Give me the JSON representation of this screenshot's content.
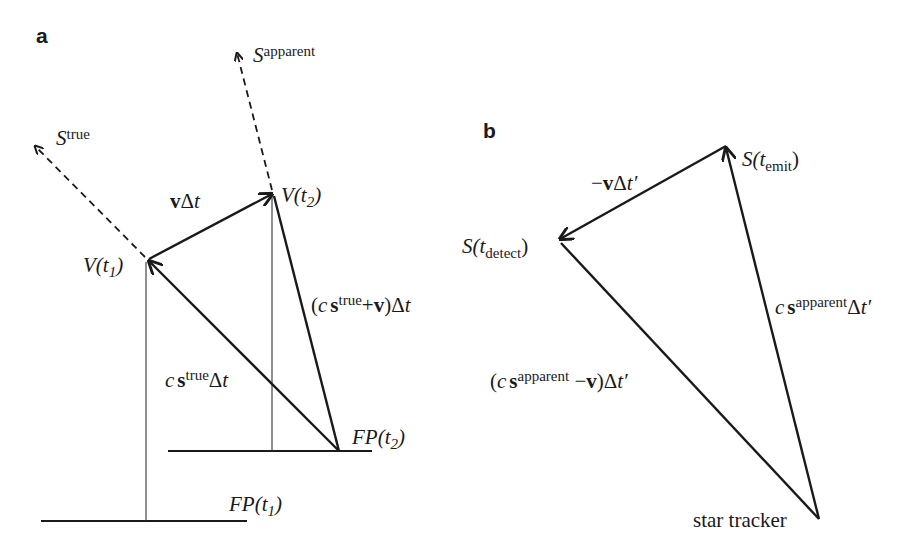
{
  "figure": {
    "panel_a": {
      "label": "a",
      "labels": {
        "s_apparent": {
          "base": "S",
          "sup": "apparent"
        },
        "s_true": {
          "base": "S",
          "sup": "true"
        },
        "v_t2": {
          "pre": "V(",
          "var": "t",
          "sub": "2",
          "post": ")"
        },
        "v_t1": {
          "pre": "V(",
          "var": "t",
          "sub": "1",
          "post": ")"
        },
        "v_delta_t": {
          "bold": "v",
          "rest": "Δ",
          "var": "t"
        },
        "c_strue_v_dt": {
          "open": "(",
          "c": "c",
          "s": "s",
          "sup": "true",
          "plus": "+",
          "v": "v",
          "close": ")Δ",
          "var": "t"
        },
        "c_strue_dt": {
          "c": "c",
          "s": "s",
          "sup": "true",
          "rest": "Δ",
          "var": "t"
        },
        "fp_t2": {
          "pre": "FP(",
          "var": "t",
          "sub": "2",
          "post": ")"
        },
        "fp_t1": {
          "pre": "FP(",
          "var": "t",
          "sub": "1",
          "post": ")"
        }
      }
    },
    "panel_b": {
      "label": "b",
      "labels": {
        "s_emit": {
          "pre": "S(",
          "var": "t",
          "sub": "emit",
          "post": ")"
        },
        "s_detect": {
          "pre": "S(",
          "var": "t",
          "sub": "detect",
          "post": ")"
        },
        "neg_v_dt": {
          "minus": "−",
          "v": "v",
          "rest": "Δ",
          "var": "t′"
        },
        "c_sapp_dt": {
          "c": "c",
          "s": "s",
          "sup": "apparent",
          "rest": "Δ",
          "var": "t′"
        },
        "c_sapp_minus_v_dt": {
          "open": "(",
          "c": "c",
          "s": "s",
          "sup": "apparent",
          "minus": " −",
          "v": "v",
          "close": ")Δ",
          "var": "t′"
        },
        "star_tracker": "star tracker"
      }
    }
  }
}
